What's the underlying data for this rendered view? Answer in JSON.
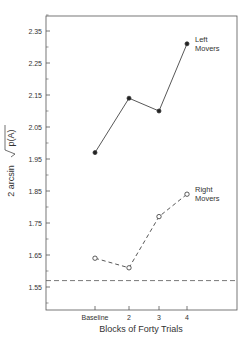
{
  "chart_data": {
    "type": "line",
    "title": "",
    "xlabel": "Blocks of Forty Trials",
    "ylabel": "2 arcsin √p(A)",
    "ylabel_prefix": "2 arcsin",
    "ylabel_radicand": "p(A)",
    "categories": [
      "Baseline",
      "2",
      "3",
      "4"
    ],
    "yticks": [
      1.55,
      1.65,
      1.75,
      1.85,
      1.95,
      2.05,
      2.15,
      2.25,
      2.35
    ],
    "ytick_labels": [
      "1.55",
      "1.65",
      "1.75",
      "1.85",
      "1.95",
      "2.05",
      "2.15",
      "2.25",
      "2.35"
    ],
    "ylim": [
      1.48,
      2.4
    ],
    "grid": false,
    "series": [
      {
        "name": "Left Movers",
        "label_lines": [
          "Left",
          "Movers"
        ],
        "marker": "filled-circle",
        "line": "solid",
        "values": [
          1.97,
          2.14,
          2.1,
          2.31
        ]
      },
      {
        "name": "Right Movers",
        "label_lines": [
          "Right",
          "Movers"
        ],
        "marker": "open-circle",
        "line": "dashed",
        "values": [
          1.64,
          1.61,
          1.77,
          1.84
        ]
      }
    ],
    "reference_line": {
      "style": "dashed",
      "value": 1.57
    }
  }
}
